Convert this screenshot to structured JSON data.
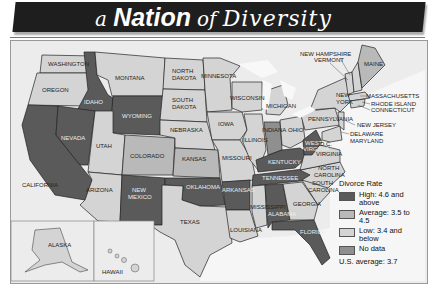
{
  "title": {
    "part1": "a",
    "part2": "Nation",
    "part3": "of",
    "part4": "Diversity"
  },
  "legend": {
    "title": "Divorce Rate",
    "items": [
      {
        "label": "High: 4.6 and above",
        "color": "#5a5a5a"
      },
      {
        "label": "Average: 3.5 to 4.5",
        "color": "#b9b9b9"
      },
      {
        "label": "Low: 3.4 and below",
        "color": "#d4d4d4"
      },
      {
        "label": "No data",
        "color": "#8f8f8f"
      }
    ],
    "us_average": "U.S. average: 3.7"
  },
  "colors": {
    "high": "#5a5a5a",
    "average": "#b9b9b9",
    "low": "#d4d4d4",
    "nodata": "#8f8f8f",
    "water": "#f4f4f4",
    "background": "#ececec"
  },
  "states": {
    "washington": "WASHINGTON",
    "oregon": "OREGON",
    "california": "CALIFORNIA",
    "idaho": "IDAHO",
    "nevada": "NEVADA",
    "montana": "MONTANA",
    "wyoming": "WYOMING",
    "utah": "UTAH",
    "colorado": "COLORADO",
    "arizona": "ARIZONA",
    "new_mexico_1": "NEW",
    "new_mexico_2": "MEXICO",
    "north_dakota_1": "NORTH",
    "north_dakota_2": "DAKOTA",
    "south_dakota_1": "SOUTH",
    "south_dakota_2": "DAKOTA",
    "nebraska": "NEBRASKA",
    "kansas": "KANSAS",
    "oklahoma": "OKLAHOMA",
    "texas": "TEXAS",
    "minnesota": "MINNESOTA",
    "iowa": "IOWA",
    "missouri": "MISSOURI",
    "arkansas": "ARKANSAS",
    "louisiana": "LOUISIANA",
    "wisconsin": "WISCONSIN",
    "illinois": "ILLINOIS",
    "michigan": "MICHIGAN",
    "indiana": "INDIANA",
    "ohio": "OHIO",
    "kentucky": "KENTUCKY",
    "tennessee": "TENNESSEE",
    "mississippi": "MISSISSIPPI",
    "alabama": "ALABAMA",
    "georgia": "GEORGIA",
    "florida": "FLORIDA",
    "south_carolina_1": "SOUTH",
    "south_carolina_2": "CAROLINA",
    "north_carolina_1": "NORTH",
    "north_carolina_2": "CAROLINA",
    "virginia": "VIRGINIA",
    "west_virginia_1": "WEST",
    "west_virginia_2": "VIRGINIA",
    "dc": "D.C.",
    "pennsylvania": "PENNSYLVANIA",
    "new_york_1": "NEW",
    "new_york_2": "YORK",
    "new_jersey": "NEW JERSEY",
    "delaware": "DELAWARE",
    "maryland": "MARYLAND",
    "connecticut": "CONNECTICUT",
    "rhode_island": "RHODE ISLAND",
    "massachusetts": "MASSACHUSETTS",
    "vermont": "VERMONT",
    "new_hampshire": "NEW HAMPSHIRE",
    "maine": "MAINE",
    "alaska": "ALASKA",
    "hawaii": "HAWAII"
  }
}
